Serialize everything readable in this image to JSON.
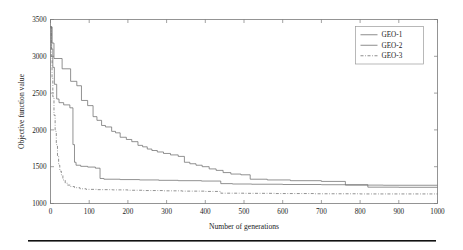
{
  "chart_data": {
    "type": "line",
    "title": "",
    "xlabel": "Number of generations",
    "ylabel": "Objective function value",
    "xlim": [
      0,
      1000
    ],
    "ylim": [
      1000,
      3500
    ],
    "xticks": [
      0,
      100,
      200,
      300,
      400,
      500,
      600,
      700,
      800,
      900,
      1000
    ],
    "yticks": [
      1000,
      1500,
      2000,
      2500,
      3000,
      3500
    ],
    "grid": false,
    "legend_position": "top-right",
    "legend": [
      "GEO-1",
      "GEO-2",
      "GEO-3"
    ],
    "series": [
      {
        "name": "GEO-1",
        "style": "solid",
        "color": "#6e6e6e",
        "points": [
          [
            0,
            3400
          ],
          [
            4,
            3400
          ],
          [
            4,
            3180
          ],
          [
            9,
            3180
          ],
          [
            9,
            2970
          ],
          [
            30,
            2970
          ],
          [
            30,
            2830
          ],
          [
            52,
            2830
          ],
          [
            52,
            2660
          ],
          [
            68,
            2660
          ],
          [
            68,
            2600
          ],
          [
            80,
            2600
          ],
          [
            80,
            2400
          ],
          [
            96,
            2400
          ],
          [
            96,
            2330
          ],
          [
            110,
            2330
          ],
          [
            110,
            2180
          ],
          [
            120,
            2180
          ],
          [
            120,
            2130
          ],
          [
            132,
            2130
          ],
          [
            132,
            2060
          ],
          [
            142,
            2060
          ],
          [
            142,
            2040
          ],
          [
            158,
            2040
          ],
          [
            158,
            1980
          ],
          [
            168,
            1980
          ],
          [
            168,
            1960
          ],
          [
            180,
            1960
          ],
          [
            180,
            1900
          ],
          [
            196,
            1900
          ],
          [
            196,
            1870
          ],
          [
            210,
            1870
          ],
          [
            210,
            1840
          ],
          [
            226,
            1840
          ],
          [
            226,
            1790
          ],
          [
            238,
            1790
          ],
          [
            238,
            1770
          ],
          [
            250,
            1770
          ],
          [
            250,
            1740
          ],
          [
            262,
            1740
          ],
          [
            262,
            1720
          ],
          [
            276,
            1720
          ],
          [
            276,
            1700
          ],
          [
            292,
            1700
          ],
          [
            292,
            1680
          ],
          [
            310,
            1680
          ],
          [
            310,
            1660
          ],
          [
            330,
            1660
          ],
          [
            330,
            1640
          ],
          [
            346,
            1640
          ],
          [
            346,
            1560
          ],
          [
            360,
            1560
          ],
          [
            360,
            1540
          ],
          [
            376,
            1540
          ],
          [
            376,
            1520
          ],
          [
            392,
            1520
          ],
          [
            392,
            1500
          ],
          [
            410,
            1500
          ],
          [
            410,
            1470
          ],
          [
            428,
            1470
          ],
          [
            428,
            1450
          ],
          [
            446,
            1450
          ],
          [
            446,
            1420
          ],
          [
            466,
            1420
          ],
          [
            466,
            1400
          ],
          [
            492,
            1400
          ],
          [
            492,
            1390
          ],
          [
            516,
            1390
          ],
          [
            516,
            1330
          ],
          [
            560,
            1330
          ],
          [
            560,
            1320
          ],
          [
            620,
            1320
          ],
          [
            620,
            1310
          ],
          [
            700,
            1310
          ],
          [
            700,
            1300
          ],
          [
            762,
            1300
          ],
          [
            762,
            1250
          ],
          [
            860,
            1250
          ],
          [
            860,
            1248
          ],
          [
            1000,
            1248
          ]
        ]
      },
      {
        "name": "GEO-2",
        "style": "solid",
        "color": "#6e6e6e",
        "points": [
          [
            0,
            3400
          ],
          [
            3,
            3400
          ],
          [
            3,
            3100
          ],
          [
            6,
            3100
          ],
          [
            6,
            2850
          ],
          [
            10,
            2850
          ],
          [
            10,
            2620
          ],
          [
            16,
            2620
          ],
          [
            16,
            2420
          ],
          [
            22,
            2420
          ],
          [
            22,
            2370
          ],
          [
            34,
            2370
          ],
          [
            34,
            2340
          ],
          [
            50,
            2340
          ],
          [
            50,
            2300
          ],
          [
            58,
            2300
          ],
          [
            58,
            1800
          ],
          [
            62,
            1800
          ],
          [
            62,
            1560
          ],
          [
            66,
            1560
          ],
          [
            66,
            1520
          ],
          [
            78,
            1520
          ],
          [
            78,
            1505
          ],
          [
            96,
            1505
          ],
          [
            96,
            1495
          ],
          [
            116,
            1495
          ],
          [
            116,
            1480
          ],
          [
            128,
            1480
          ],
          [
            128,
            1340
          ],
          [
            138,
            1340
          ],
          [
            138,
            1330
          ],
          [
            180,
            1330
          ],
          [
            180,
            1325
          ],
          [
            230,
            1325
          ],
          [
            230,
            1320
          ],
          [
            280,
            1320
          ],
          [
            280,
            1315
          ],
          [
            330,
            1315
          ],
          [
            330,
            1310
          ],
          [
            390,
            1310
          ],
          [
            390,
            1305
          ],
          [
            440,
            1305
          ],
          [
            440,
            1270
          ],
          [
            470,
            1270
          ],
          [
            470,
            1265
          ],
          [
            520,
            1265
          ],
          [
            520,
            1262
          ],
          [
            600,
            1262
          ],
          [
            600,
            1258
          ],
          [
            700,
            1258
          ],
          [
            700,
            1255
          ],
          [
            820,
            1255
          ],
          [
            820,
            1222
          ],
          [
            900,
            1222
          ],
          [
            900,
            1220
          ],
          [
            1000,
            1220
          ]
        ]
      },
      {
        "name": "GEO-3",
        "style": "dash-dot",
        "color": "#6e6e6e",
        "points": [
          [
            0,
            3400
          ],
          [
            2,
            3400
          ],
          [
            2,
            3000
          ],
          [
            4,
            3000
          ],
          [
            4,
            2700
          ],
          [
            6,
            2700
          ],
          [
            6,
            2450
          ],
          [
            9,
            2450
          ],
          [
            9,
            2200
          ],
          [
            12,
            2200
          ],
          [
            12,
            1980
          ],
          [
            15,
            1980
          ],
          [
            15,
            1800
          ],
          [
            18,
            1800
          ],
          [
            18,
            1640
          ],
          [
            21,
            1640
          ],
          [
            21,
            1520
          ],
          [
            24,
            1520
          ],
          [
            24,
            1440
          ],
          [
            28,
            1440
          ],
          [
            28,
            1390
          ],
          [
            32,
            1390
          ],
          [
            32,
            1320
          ],
          [
            38,
            1320
          ],
          [
            38,
            1275
          ],
          [
            44,
            1275
          ],
          [
            44,
            1250
          ],
          [
            52,
            1250
          ],
          [
            52,
            1230
          ],
          [
            62,
            1230
          ],
          [
            62,
            1215
          ],
          [
            76,
            1215
          ],
          [
            76,
            1200
          ],
          [
            92,
            1200
          ],
          [
            92,
            1192
          ],
          [
            120,
            1192
          ],
          [
            120,
            1188
          ],
          [
            160,
            1188
          ],
          [
            160,
            1185
          ],
          [
            200,
            1185
          ],
          [
            200,
            1180
          ],
          [
            240,
            1180
          ],
          [
            240,
            1176
          ],
          [
            290,
            1176
          ],
          [
            290,
            1172
          ],
          [
            340,
            1172
          ],
          [
            340,
            1168
          ],
          [
            400,
            1168
          ],
          [
            400,
            1164
          ],
          [
            440,
            1164
          ],
          [
            440,
            1140
          ],
          [
            500,
            1140
          ],
          [
            500,
            1138
          ],
          [
            580,
            1138
          ],
          [
            580,
            1135
          ],
          [
            680,
            1135
          ],
          [
            680,
            1132
          ],
          [
            800,
            1132
          ],
          [
            800,
            1130
          ],
          [
            1000,
            1130
          ]
        ]
      }
    ]
  },
  "figure": {
    "rule_visible": true
  }
}
